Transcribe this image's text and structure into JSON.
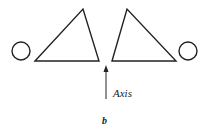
{
  "figure": {
    "axis_label": "Axis",
    "panel_label": "b",
    "stroke_color": "#222222",
    "background": "#ffffff"
  },
  "shapes": {
    "left_circle": {
      "cx": 21,
      "cy": 51,
      "r": 9
    },
    "left_triangle": {
      "points": "35,61 83,9 99,61"
    },
    "right_triangle": {
      "points": "112,61 127,9 176,61"
    },
    "right_circle": {
      "cx": 188,
      "cy": 51,
      "r": 9
    },
    "axis_arrow": {
      "x": 106,
      "y1": 99,
      "y2": 66
    }
  }
}
